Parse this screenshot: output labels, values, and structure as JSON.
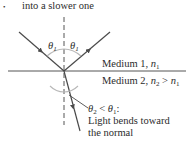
{
  "caption": {
    "bullet": "•",
    "text": "into a slower one"
  },
  "diagram": {
    "angle_label_incident": "θ",
    "angle_label_incident_sub": "1",
    "angle_label_reflected": "θ",
    "angle_label_reflected_sub": "1",
    "medium1": {
      "prefix": "Medium 1, ",
      "var": "n",
      "sub": "1"
    },
    "medium2": {
      "prefix": "Medium 2, ",
      "var1": "n",
      "sub1": "2",
      "op": " > ",
      "var2": "n",
      "sub2": "1"
    },
    "note": {
      "theta2": "θ",
      "theta2_sub": "2",
      "op": " < ",
      "theta1": "θ",
      "theta1_sub": "1",
      "colon": ":",
      "line2": "Light bends toward",
      "line3": "the normal"
    },
    "colors": {
      "ray": "#4a4a4a",
      "arc": "#b8b8b8",
      "line": "#555555"
    }
  }
}
